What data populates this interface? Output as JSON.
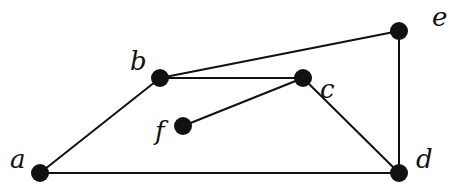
{
  "graph": {
    "nodes": [
      {
        "id": "a",
        "label": "a",
        "x": 40,
        "y": 173,
        "lx": 10,
        "ly": 168
      },
      {
        "id": "b",
        "label": "b",
        "x": 160,
        "y": 78,
        "lx": 130,
        "ly": 70
      },
      {
        "id": "c",
        "label": "c",
        "x": 303,
        "y": 78,
        "lx": 320,
        "ly": 98
      },
      {
        "id": "d",
        "label": "d",
        "x": 399,
        "y": 173,
        "lx": 416,
        "ly": 168
      },
      {
        "id": "e",
        "label": "e",
        "x": 399,
        "y": 31,
        "lx": 432,
        "ly": 26
      },
      {
        "id": "f",
        "label": "f",
        "x": 183,
        "y": 126,
        "lx": 155,
        "ly": 140
      }
    ],
    "edges": [
      [
        "a",
        "b"
      ],
      [
        "a",
        "d"
      ],
      [
        "b",
        "c"
      ],
      [
        "b",
        "e"
      ],
      [
        "c",
        "f"
      ],
      [
        "c",
        "d"
      ],
      [
        "e",
        "d"
      ]
    ]
  }
}
